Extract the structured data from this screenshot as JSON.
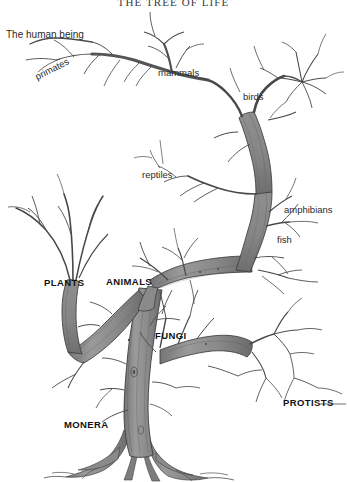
{
  "page": {
    "title": "THE TREE OF LIFE",
    "background_color": "#ffffff",
    "width": 347,
    "height": 482
  },
  "illustration": {
    "subject": "tree-of-life",
    "style": "hand-drawn pen and ink with gray wash",
    "trunk_fill_color": "#8d8d8d",
    "trunk_shade_color": "#6f6f6f",
    "outline_color": "#3a3a3a",
    "branch_color": "#4a4a4a"
  },
  "labels": {
    "human": {
      "text": "The human being",
      "x": 6,
      "y": 30
    },
    "groups": [
      {
        "name": "primates",
        "text": "primates",
        "x": 38,
        "y": 82,
        "rotated": true
      },
      {
        "name": "mammals",
        "text": "mammals",
        "x": 158,
        "y": 80,
        "rotated": false
      },
      {
        "name": "birds",
        "text": "birds",
        "x": 243,
        "y": 103,
        "rotated": false
      },
      {
        "name": "reptiles",
        "text": "reptiles",
        "x": 142,
        "y": 181,
        "rotated": false
      },
      {
        "name": "amphibians",
        "text": "amphibians",
        "x": 284,
        "y": 216,
        "rotated": false
      },
      {
        "name": "fish",
        "text": "fish",
        "x": 277,
        "y": 246,
        "rotated": false
      }
    ],
    "kingdoms": [
      {
        "name": "plants",
        "text": "PLANTS",
        "x": 44,
        "y": 288
      },
      {
        "name": "animals",
        "text": "ANIMALS",
        "x": 106,
        "y": 287
      },
      {
        "name": "fungi",
        "text": "FUNGI",
        "x": 155,
        "y": 341
      },
      {
        "name": "protists",
        "text": "PROTISTS",
        "x": 283,
        "y": 408
      },
      {
        "name": "monera",
        "text": "MONERA",
        "x": 64,
        "y": 430
      }
    ]
  }
}
